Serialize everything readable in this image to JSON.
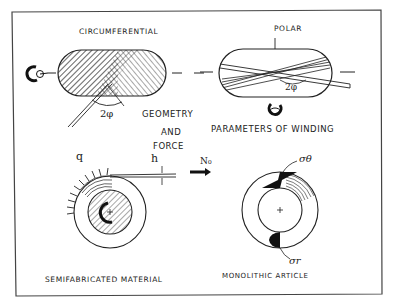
{
  "diagram": {
    "title": "",
    "colors": {
      "ink": "#222222",
      "paper": "#ffffff",
      "frame": "#555555"
    },
    "panels": {
      "circumferential": {
        "label": "CIRCUMFERENTIAL",
        "angle_label": "2φ",
        "icon": "rotation-arrow-icon"
      },
      "polar": {
        "label": "POLAR",
        "angle_label": "2φ",
        "icon": "rotation-arrow-icon"
      },
      "semifabricated": {
        "label": "SEMIFABRICATED MATERIAL",
        "load_label": "q",
        "thickness_label": "h"
      },
      "monolithic": {
        "label": "MONOLITHIC ARTICLE",
        "stress_theta_label": "σθ",
        "stress_r_label": "σr"
      }
    },
    "captions": {
      "geometry_line1": "GEOMETRY",
      "geometry_line2": "AND",
      "geometry_line3": "FORCE",
      "parameters": "PARAMETERS OF WINDING"
    },
    "transition": {
      "arrow_label": "N₀"
    }
  }
}
